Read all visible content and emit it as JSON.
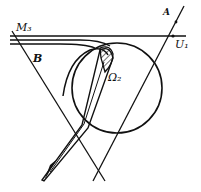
{
  "diagram": {
    "labels": {
      "M3": "M₃",
      "A": "A",
      "U1": "U₁",
      "B": "B",
      "Omega2": "Ω₂"
    },
    "colors": {
      "stroke": "#111111",
      "background": "#ffffff"
    }
  }
}
